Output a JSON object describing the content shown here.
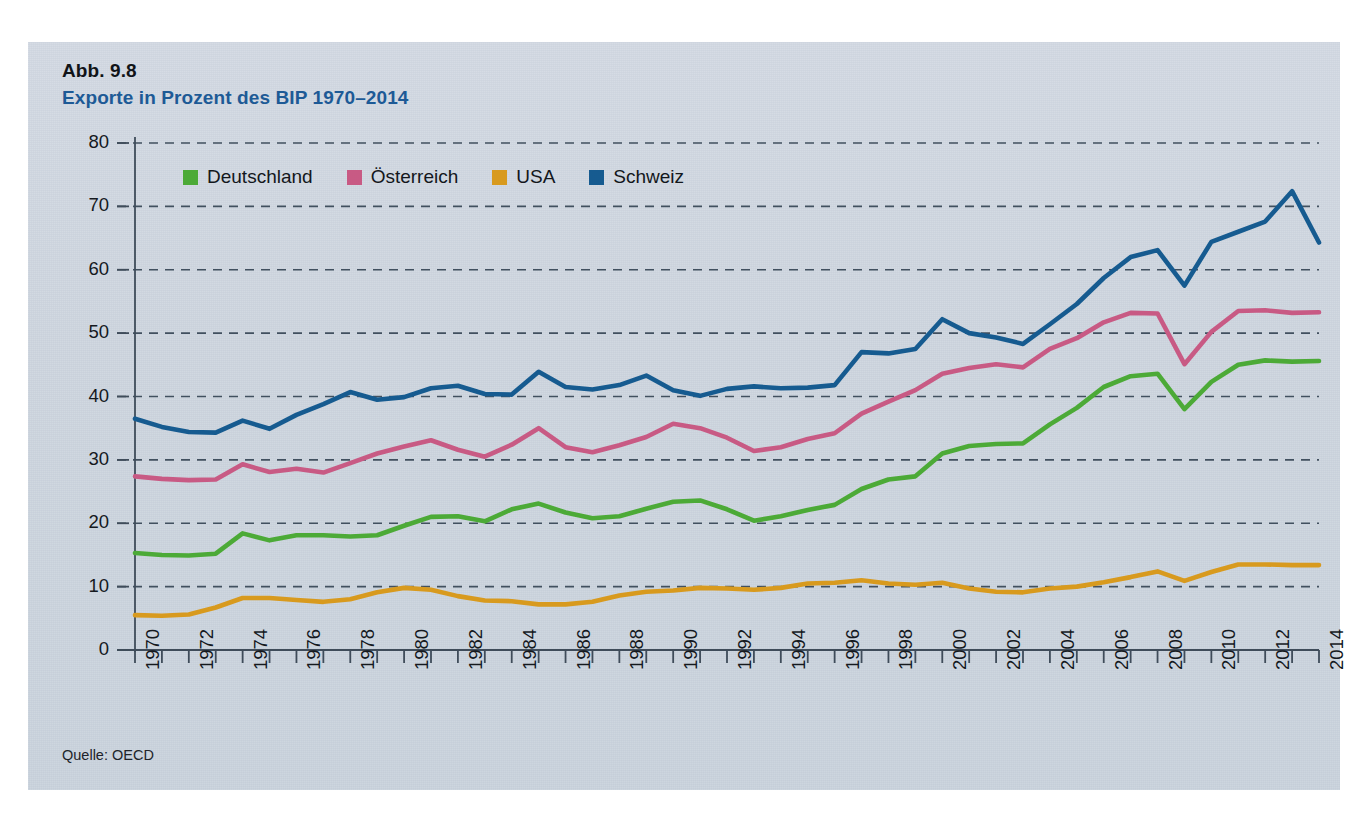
{
  "figure": {
    "number_label": "Abb. 9.8",
    "title": "Exporte in Prozent des BIP 1970–2014",
    "source": "Quelle: OECD",
    "panel_bg": "#ced6e0",
    "title_color": "#1d5a96",
    "label_color": "#111418"
  },
  "legend": {
    "position": "top-left-inside",
    "items": [
      {
        "label": "Deutschland",
        "color": "#4caa37"
      },
      {
        "label": "Österreich",
        "color": "#c85a84"
      },
      {
        "label": "USA",
        "color": "#d89a1e"
      },
      {
        "label": "Schweiz",
        "color": "#165b90"
      }
    ]
  },
  "chart_data": {
    "type": "line",
    "title": "Exporte in Prozent des BIP 1970–2014",
    "xlabel": "",
    "ylabel": "",
    "xlim": [
      1970,
      2014
    ],
    "ylim": [
      0,
      80
    ],
    "ytick_step": 10,
    "yticks": [
      0,
      10,
      20,
      30,
      40,
      50,
      60,
      70,
      80
    ],
    "xticks": [
      1970,
      1971,
      1972,
      1973,
      1974,
      1975,
      1976,
      1977,
      1978,
      1979,
      1980,
      1981,
      1982,
      1983,
      1984,
      1985,
      1986,
      1987,
      1988,
      1989,
      1990,
      1991,
      1992,
      1993,
      1994,
      1995,
      1996,
      1997,
      1998,
      1999,
      2000,
      2001,
      2002,
      2003,
      2004,
      2005,
      2006,
      2007,
      2008,
      2009,
      2010,
      2011,
      2012,
      2013,
      2014
    ],
    "xtick_labels": [
      "1970",
      "",
      "1972",
      "",
      "1974",
      "",
      "1976",
      "",
      "1978",
      "",
      "1980",
      "",
      "1982",
      "",
      "1984",
      "",
      "1986",
      "",
      "1988",
      "",
      "1990",
      "",
      "1992",
      "",
      "1994",
      "",
      "1996",
      "",
      "1998",
      "",
      "2000",
      "",
      "2002",
      "",
      "2004",
      "",
      "2006",
      "",
      "2008",
      "",
      "2010",
      "",
      "2012",
      "",
      "2014"
    ],
    "grid": true,
    "grid_style": "dashed-horizontal",
    "x": [
      1970,
      1971,
      1972,
      1973,
      1974,
      1975,
      1976,
      1977,
      1978,
      1979,
      1980,
      1981,
      1982,
      1983,
      1984,
      1985,
      1986,
      1987,
      1988,
      1989,
      1990,
      1991,
      1992,
      1993,
      1994,
      1995,
      1996,
      1997,
      1998,
      1999,
      2000,
      2001,
      2002,
      2003,
      2004,
      2005,
      2006,
      2007,
      2008,
      2009,
      2010,
      2011,
      2012,
      2013,
      2014
    ],
    "series": [
      {
        "name": "Deutschland",
        "color": "#4caa37",
        "values": [
          15.3,
          15.0,
          14.9,
          15.2,
          18.4,
          17.3,
          18.1,
          18.1,
          17.9,
          18.1,
          19.6,
          21.0,
          21.1,
          20.3,
          22.2,
          23.1,
          21.7,
          20.8,
          21.1,
          22.3,
          23.4,
          23.6,
          22.2,
          20.4,
          21.1,
          22.1,
          22.9,
          25.4,
          26.9,
          27.4,
          31.0,
          32.2,
          32.5,
          32.6,
          35.6,
          38.2,
          41.5,
          43.2,
          43.6,
          38.0,
          42.3,
          45.0,
          45.7,
          45.5,
          45.6
        ]
      },
      {
        "name": "Österreich",
        "color": "#c85a84",
        "values": [
          27.4,
          27.0,
          26.8,
          26.9,
          29.3,
          28.1,
          28.6,
          28.0,
          29.5,
          31.0,
          32.1,
          33.1,
          31.6,
          30.5,
          32.4,
          35.0,
          32.0,
          31.2,
          32.3,
          33.6,
          35.7,
          35.0,
          33.5,
          31.4,
          32.0,
          33.3,
          34.2,
          37.3,
          39.2,
          41.0,
          43.6,
          44.5,
          45.1,
          44.6,
          47.5,
          49.2,
          51.7,
          53.2,
          53.1,
          45.1,
          50.2,
          53.5,
          53.6,
          53.2,
          53.3
        ]
      },
      {
        "name": "USA",
        "color": "#d89a1e",
        "values": [
          5.5,
          5.4,
          5.6,
          6.7,
          8.2,
          8.2,
          7.9,
          7.6,
          8.0,
          9.1,
          9.8,
          9.5,
          8.5,
          7.8,
          7.7,
          7.2,
          7.2,
          7.6,
          8.6,
          9.2,
          9.4,
          9.8,
          9.7,
          9.5,
          9.8,
          10.5,
          10.6,
          11.0,
          10.5,
          10.3,
          10.6,
          9.7,
          9.2,
          9.1,
          9.7,
          10.0,
          10.7,
          11.5,
          12.4,
          10.9,
          12.3,
          13.5,
          13.5,
          13.4,
          13.4
        ]
      },
      {
        "name": "Schweiz",
        "color": "#165b90",
        "values": [
          36.5,
          35.2,
          34.4,
          34.3,
          36.2,
          34.9,
          37.1,
          38.8,
          40.7,
          39.5,
          39.9,
          41.3,
          41.7,
          40.4,
          40.3,
          43.9,
          41.5,
          41.1,
          41.8,
          43.3,
          41.0,
          40.1,
          41.2,
          41.6,
          41.3,
          41.4,
          41.8,
          47.0,
          46.8,
          47.5,
          52.2,
          50.0,
          49.3,
          48.3,
          51.4,
          54.6,
          58.7,
          62.0,
          63.1,
          57.5,
          64.4,
          66.0,
          67.6,
          72.4,
          64.3
        ]
      }
    ]
  },
  "axes": {
    "y_tick_labels": [
      "80",
      "70",
      "60",
      "50",
      "40",
      "30",
      "20",
      "10",
      "0"
    ],
    "x_tick_labels_visible": [
      "1970",
      "1972",
      "1974",
      "1976",
      "1978",
      "1980",
      "1982",
      "1984",
      "1986",
      "1988",
      "1990",
      "1992",
      "1994",
      "1996",
      "1998",
      "2000",
      "2002",
      "2004",
      "2006",
      "2008",
      "2010",
      "2012",
      "2014"
    ]
  }
}
